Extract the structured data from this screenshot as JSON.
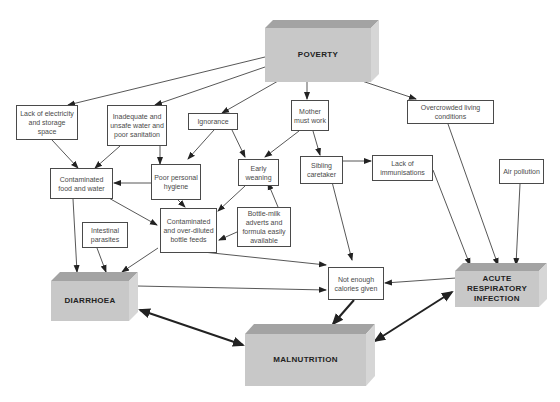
{
  "diagram": {
    "type": "causal flow diagram",
    "primary": {
      "poverty": "POVERTY",
      "diarrhoea": "DIARRHOEA",
      "malnutrition": "MALNUTRITION",
      "ari": "ACUTE RESPIRATORY INFECTION"
    },
    "nodes": {
      "lack_electricity": "Lack of electricity and storage space",
      "inadequate_water": "Inadequate and unsafe water and poor sanitation",
      "ignorance": "Ignorance",
      "mother_work": "Mother must work",
      "overcrowded": "Overcrowded living conditions",
      "contaminated_food": "Contaminated food and water",
      "poor_hygiene": "Poor personal hygiene",
      "early_weaning": "Early weaning",
      "sibling_caretaker": "Sibling caretaker",
      "lack_immunisations": "Lack of immunisations",
      "air_pollution": "Air pollution",
      "intestinal_parasites": "Intestinal parasites",
      "bottle_feeds": "Contaminated and over-diluted bottle feeds",
      "bottle_adverts": "Bottle-milk adverts and formula easily available",
      "not_enough_calories": "Not enough calories given"
    },
    "edges": [
      {
        "from": "POVERTY",
        "to": "Lack of electricity and storage space"
      },
      {
        "from": "POVERTY",
        "to": "Inadequate and unsafe water and poor sanitation"
      },
      {
        "from": "POVERTY",
        "to": "Ignorance"
      },
      {
        "from": "POVERTY",
        "to": "Mother must work"
      },
      {
        "from": "POVERTY",
        "to": "Overcrowded living conditions"
      },
      {
        "from": "Lack of electricity and storage space",
        "to": "Contaminated food and water"
      },
      {
        "from": "Inadequate and unsafe water and poor sanitation",
        "to": "Contaminated food and water"
      },
      {
        "from": "Inadequate and unsafe water and poor sanitation",
        "to": "Poor personal hygiene"
      },
      {
        "from": "Ignorance",
        "to": "Poor personal hygiene"
      },
      {
        "from": "Ignorance",
        "to": "Early weaning"
      },
      {
        "from": "Mother must work",
        "to": "Early weaning"
      },
      {
        "from": "Mother must work",
        "to": "Sibling caretaker"
      },
      {
        "from": "Poor personal hygiene",
        "to": "Contaminated food and water"
      },
      {
        "from": "Poor personal hygiene",
        "to": "Contaminated and over-diluted bottle feeds"
      },
      {
        "from": "Early weaning",
        "to": "Contaminated and over-diluted bottle feeds"
      },
      {
        "from": "Bottle-milk adverts and formula easily available",
        "to": "Early weaning"
      },
      {
        "from": "Bottle-milk adverts and formula easily available",
        "to": "Contaminated and over-diluted bottle feeds"
      },
      {
        "from": "Contaminated food and water",
        "to": "Contaminated and over-diluted bottle feeds"
      },
      {
        "from": "Contaminated food and water",
        "to": "DIARRHOEA"
      },
      {
        "from": "Intestinal parasites",
        "to": "DIARRHOEA"
      },
      {
        "from": "Contaminated and over-diluted bottle feeds",
        "to": "DIARRHOEA"
      },
      {
        "from": "Contaminated and over-diluted bottle feeds",
        "to": "Not enough calories given"
      },
      {
        "from": "Sibling caretaker",
        "to": "Lack of immunisations"
      },
      {
        "from": "Sibling caretaker",
        "to": "Not enough calories given"
      },
      {
        "from": "Lack of immunisations",
        "to": "ACUTE RESPIRATORY INFECTION"
      },
      {
        "from": "Overcrowded living conditions",
        "to": "ACUTE RESPIRATORY INFECTION"
      },
      {
        "from": "Air pollution",
        "to": "ACUTE RESPIRATORY INFECTION"
      },
      {
        "from": "DIARRHOEA",
        "to": "Not enough calories given"
      },
      {
        "from": "ACUTE RESPIRATORY INFECTION",
        "to": "Not enough calories given"
      },
      {
        "from": "Not enough calories given",
        "to": "MALNUTRITION"
      },
      {
        "from": "DIARRHOEA",
        "to": "MALNUTRITION",
        "bidirectional": true
      },
      {
        "from": "ACUTE RESPIRATORY INFECTION",
        "to": "MALNUTRITION",
        "bidirectional": true
      }
    ]
  }
}
